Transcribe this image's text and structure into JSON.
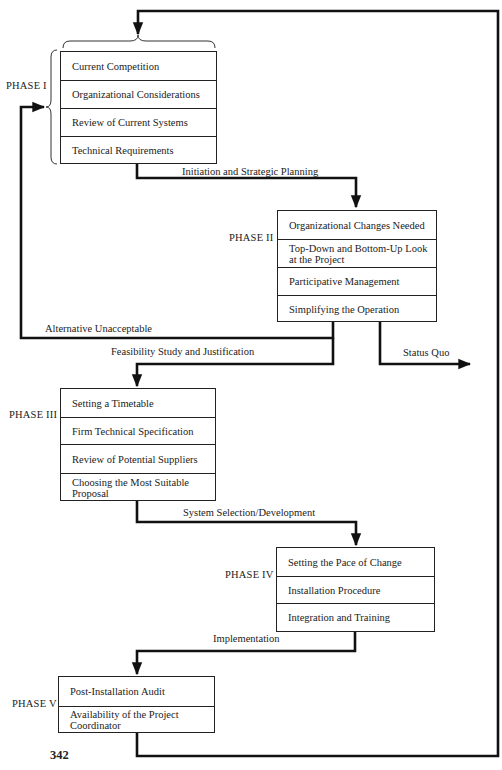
{
  "diagram": {
    "page_number": "342",
    "phases": [
      {
        "label": "PHASE I",
        "items": [
          "Current Competition",
          "Organizational Considerations",
          "Review of Current Systems",
          "Technical Requirements"
        ]
      },
      {
        "label": "PHASE II",
        "items": [
          "Organizational Changes Needed",
          "Top-Down and Bottom-Up Look at the Project",
          "Participative Management",
          "Simplifying the Operation"
        ]
      },
      {
        "label": "PHASE III",
        "items": [
          "Setting a Timetable",
          "Firm Technical Specification",
          "Review of Potential Suppliers",
          "Choosing the Most Suitable Proposal"
        ]
      },
      {
        "label": "PHASE IV",
        "items": [
          "Setting the Pace of Change",
          "Installation Procedure",
          "Integration and Training"
        ]
      },
      {
        "label": "PHASE V",
        "items": [
          "Post-Installation Audit",
          "Availability of the Project Coordinator"
        ]
      }
    ],
    "flows": {
      "phase1_to_2": "Initiation and Strategic Planning",
      "phase2_to_1": "Alternative Unacceptable",
      "phase2_to_3": "Feasibility Study and Justification",
      "phase2_exit": "Status Quo",
      "phase3_to_4": "System Selection/Development",
      "phase4_to_5": "Implementation"
    }
  }
}
